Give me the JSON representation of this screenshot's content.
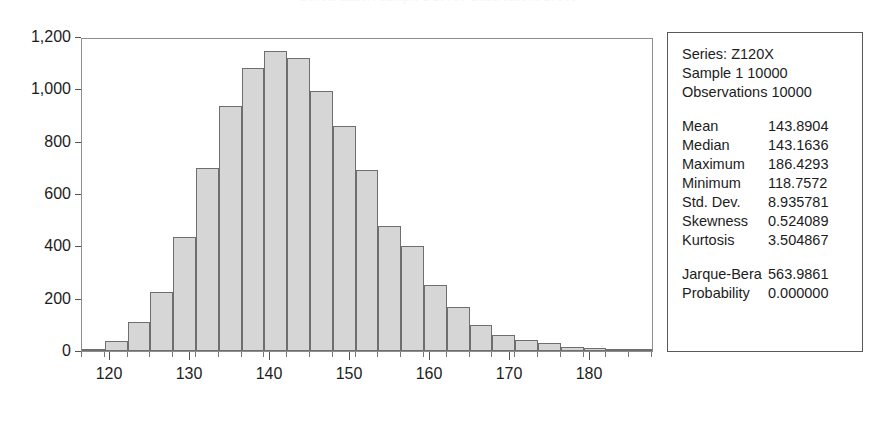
{
  "figure": {
    "cropped_title_sliver": "Series: Z120X  Sample 1 10000  Observations 10000"
  },
  "chart_data": {
    "type": "bar",
    "title": "",
    "subtitle": "",
    "xlabel": "",
    "ylabel": "",
    "grid": false,
    "legend_position": "none",
    "xlim": [
      116.5,
      188.0
    ],
    "ylim": [
      0,
      1200
    ],
    "x_ticks": [
      120,
      130,
      140,
      150,
      160,
      170,
      180
    ],
    "x_tick_labels": [
      "120",
      "130",
      "140",
      "150",
      "160",
      "170",
      "180"
    ],
    "x_minor_tick_step": 2.85,
    "y_ticks": [
      0,
      200,
      400,
      600,
      800,
      1000,
      1200
    ],
    "y_tick_labels": [
      "0",
      "200",
      "400",
      "600",
      "800",
      "1,000",
      "1,200"
    ],
    "bin_width": 2.85,
    "bin_starts": [
      116.5,
      119.35,
      122.2,
      125.05,
      127.9,
      130.75,
      133.6,
      136.45,
      139.3,
      142.15,
      145.0,
      147.85,
      150.7,
      153.55,
      156.4,
      159.25,
      162.1,
      164.95,
      167.8,
      170.65,
      173.5,
      176.35,
      179.2,
      182.05,
      184.9
    ],
    "categories": [
      "117.9",
      "120.8",
      "123.6",
      "126.5",
      "129.3",
      "132.2",
      "135.0",
      "137.9",
      "140.7",
      "143.6",
      "146.4",
      "149.3",
      "152.1",
      "155.0",
      "157.8",
      "160.7",
      "163.5",
      "166.4",
      "169.2",
      "172.1",
      "174.9",
      "177.8",
      "180.6",
      "183.5",
      "186.3"
    ],
    "values": [
      8,
      40,
      112,
      224,
      436,
      698,
      938,
      1080,
      1148,
      1118,
      994,
      860,
      690,
      478,
      402,
      254,
      168,
      100,
      62,
      44,
      32,
      14,
      10,
      6,
      4
    ],
    "bars_fill_color": "#d6d6d6",
    "bars_border_color": "#6e6e6e",
    "axis_color": "#8c8c8c"
  },
  "stats": {
    "header": [
      "Series: Z120X",
      "Sample 1 10000",
      "Observations 10000"
    ],
    "rows": [
      {
        "label": "Mean",
        "value": "143.8904"
      },
      {
        "label": "Median",
        "value": "143.1636"
      },
      {
        "label": "Maximum",
        "value": "186.4293"
      },
      {
        "label": "Minimum",
        "value": "118.7572"
      },
      {
        "label": "Std. Dev.",
        "value": "8.935781"
      },
      {
        "label": "Skewness",
        "value": "0.524089"
      },
      {
        "label": "Kurtosis",
        "value": "3.504867"
      }
    ],
    "test_rows": [
      {
        "label": "Jarque-Bera",
        "value": "563.9861"
      },
      {
        "label": "Probability",
        "value": "0.000000"
      }
    ]
  }
}
